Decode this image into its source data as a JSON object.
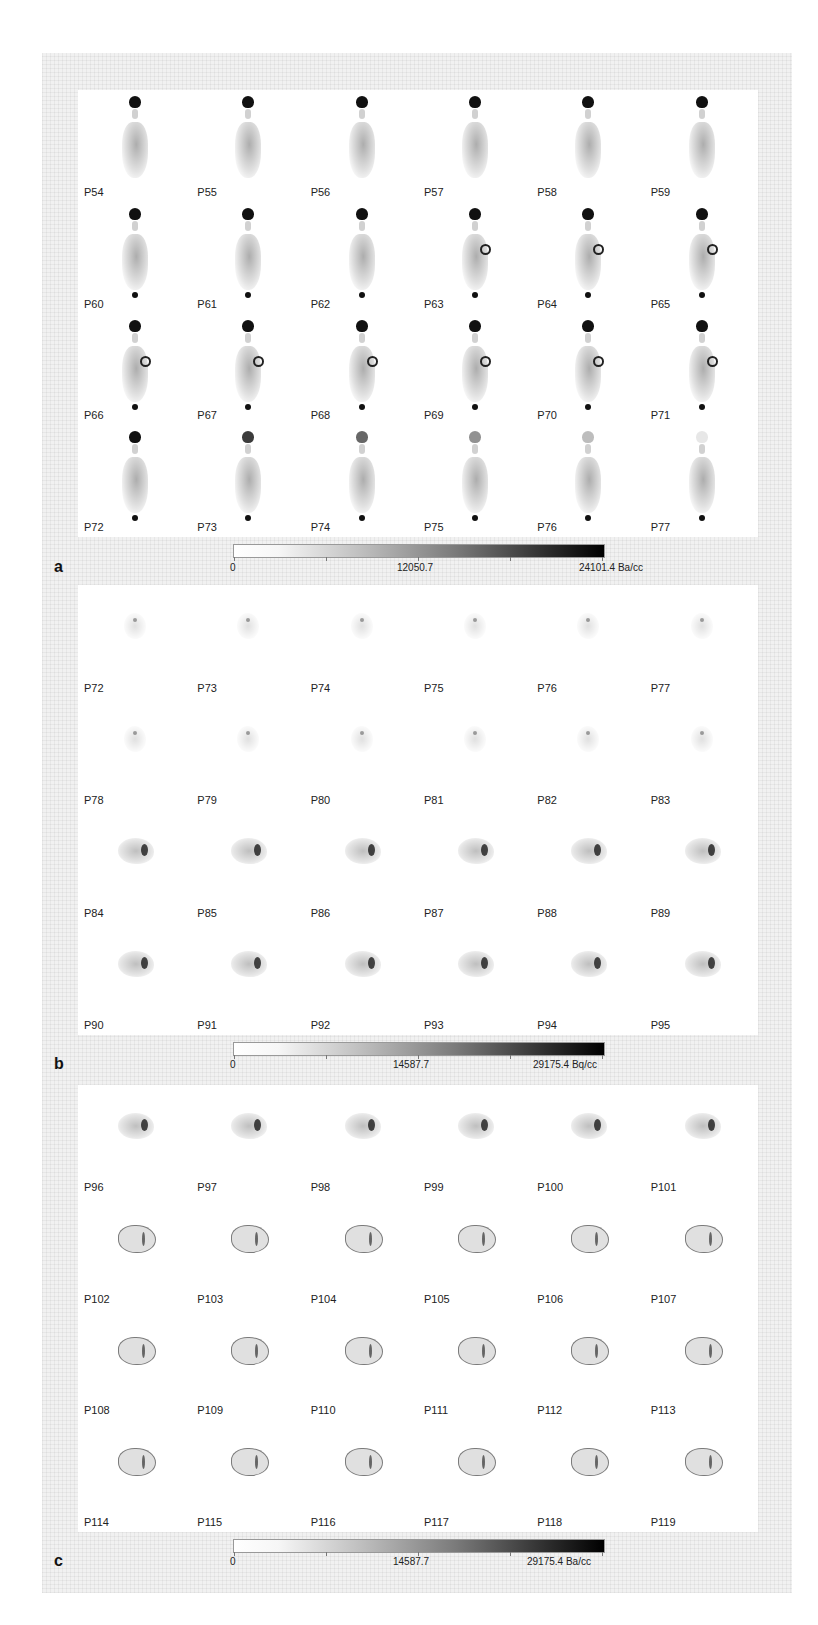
{
  "figure": {
    "panels": [
      {
        "letter": "a",
        "labels": [
          "P54",
          "P55",
          "P56",
          "P57",
          "P58",
          "P59",
          "P60",
          "P61",
          "P62",
          "P63",
          "P64",
          "P65",
          "P66",
          "P67",
          "P68",
          "P69",
          "P70",
          "P71",
          "P72",
          "P73",
          "P74",
          "P75",
          "P76",
          "P77"
        ],
        "colorbar": {
          "min": "0",
          "mid": "12050.7",
          "max": "24101.4 Ba/cc"
        }
      },
      {
        "letter": "b",
        "labels": [
          "P72",
          "P73",
          "P74",
          "P75",
          "P76",
          "P77",
          "P78",
          "P79",
          "P80",
          "P81",
          "P82",
          "P83",
          "P84",
          "P85",
          "P86",
          "P87",
          "P88",
          "P89",
          "P90",
          "P91",
          "P92",
          "P93",
          "P94",
          "P95"
        ],
        "colorbar": {
          "min": "0",
          "mid": "14587.7",
          "max": "29175.4 Bq/cc"
        }
      },
      {
        "letter": "c",
        "labels": [
          "P96",
          "P97",
          "P98",
          "P99",
          "P100",
          "P101",
          "P102",
          "P103",
          "P104",
          "P105",
          "P106",
          "P107",
          "P108",
          "P109",
          "P110",
          "P111",
          "P112",
          "P113",
          "P114",
          "P115",
          "P116",
          "P117",
          "P118",
          "P119"
        ],
        "colorbar": {
          "min": "0",
          "mid": "14587.7",
          "max": "29175.4 Ba/cc"
        }
      }
    ],
    "colors": {
      "frame": "#f1f1f1",
      "panel": "#ffffff",
      "colormap_low": "#ffffff",
      "colormap_high": "#000000"
    }
  }
}
